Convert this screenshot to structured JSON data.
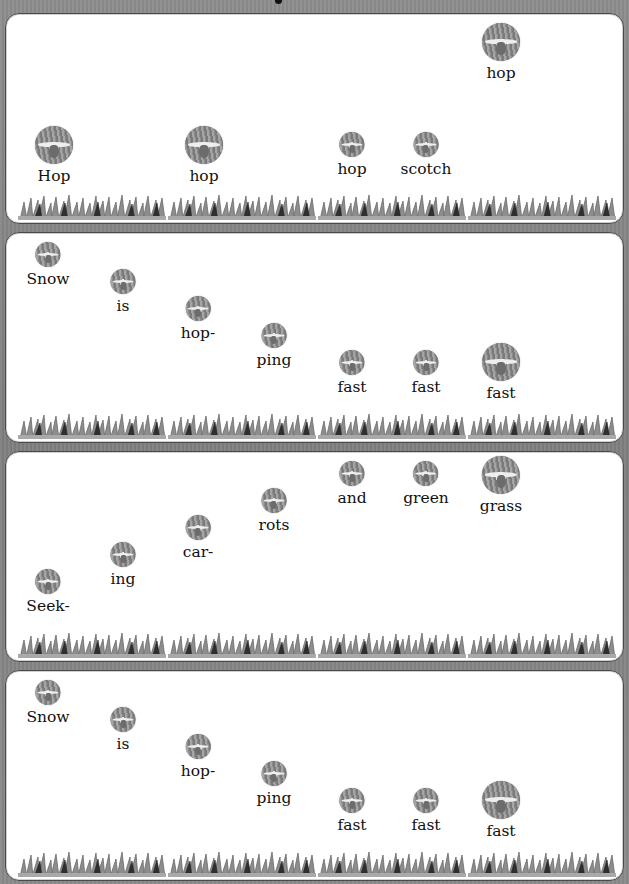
{
  "background_color": "#858585",
  "panels": [
    {
      "words": [
        {
          "text": "Hop",
          "x": 48,
          "y": 112,
          "size": "big"
        },
        {
          "text": "hop",
          "x": 198,
          "y": 112,
          "size": "big"
        },
        {
          "text": "hop",
          "x": 346,
          "y": 118,
          "size": "small"
        },
        {
          "text": "scotch",
          "x": 420,
          "y": 118,
          "size": "small"
        },
        {
          "text": "hop",
          "x": 495,
          "y": 9,
          "size": "big"
        }
      ]
    },
    {
      "words": [
        {
          "text": "Snow",
          "x": 42,
          "y": 9,
          "size": "small"
        },
        {
          "text": "is",
          "x": 117,
          "y": 36,
          "size": "small"
        },
        {
          "text": "hop-",
          "x": 192,
          "y": 63,
          "size": "small"
        },
        {
          "text": "ping",
          "x": 268,
          "y": 90,
          "size": "small"
        },
        {
          "text": "fast",
          "x": 346,
          "y": 117,
          "size": "small"
        },
        {
          "text": "fast",
          "x": 420,
          "y": 117,
          "size": "small"
        },
        {
          "text": "fast",
          "x": 495,
          "y": 110,
          "size": "big"
        }
      ]
    },
    {
      "words": [
        {
          "text": "Seek-",
          "x": 42,
          "y": 117,
          "size": "small"
        },
        {
          "text": "ing",
          "x": 117,
          "y": 90,
          "size": "small"
        },
        {
          "text": "car-",
          "x": 192,
          "y": 63,
          "size": "small"
        },
        {
          "text": "rots",
          "x": 268,
          "y": 36,
          "size": "small"
        },
        {
          "text": "and",
          "x": 346,
          "y": 9,
          "size": "small"
        },
        {
          "text": "green",
          "x": 420,
          "y": 9,
          "size": "small"
        },
        {
          "text": "grass",
          "x": 495,
          "y": 4,
          "size": "big"
        }
      ]
    },
    {
      "words": [
        {
          "text": "Snow",
          "x": 42,
          "y": 9,
          "size": "small"
        },
        {
          "text": "is",
          "x": 117,
          "y": 36,
          "size": "small"
        },
        {
          "text": "hop-",
          "x": 192,
          "y": 63,
          "size": "small"
        },
        {
          "text": "ping",
          "x": 268,
          "y": 90,
          "size": "small"
        },
        {
          "text": "fast",
          "x": 346,
          "y": 117,
          "size": "small"
        },
        {
          "text": "fast",
          "x": 420,
          "y": 117,
          "size": "small"
        },
        {
          "text": "fast",
          "x": 495,
          "y": 110,
          "size": "big"
        }
      ]
    }
  ],
  "panel_tops": [
    13,
    232,
    451,
    670
  ],
  "grass_x": [
    12,
    162,
    312,
    462
  ]
}
